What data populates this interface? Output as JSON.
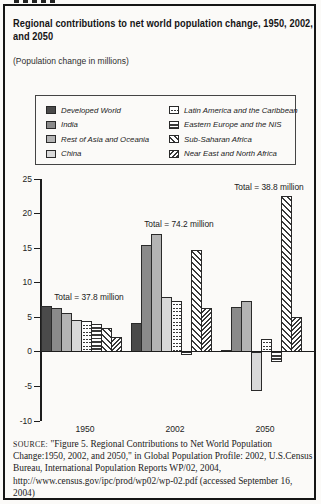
{
  "header": {
    "title": "Regional contributions to net world population change, 1950, 2002, and 2050",
    "subtitle": "(Population change in millions)"
  },
  "legend": {
    "items": [
      {
        "label": "Developed World",
        "key": "developed"
      },
      {
        "label": "India",
        "key": "india"
      },
      {
        "label": "Rest of Asia and Oceania",
        "key": "rest-asia"
      },
      {
        "label": "China",
        "key": "china"
      },
      {
        "label": "Latin America and the Caribbean",
        "key": "latin-america"
      },
      {
        "label": "Eastern Europe and the NIS",
        "key": "eastern-europe"
      },
      {
        "label": "Sub-Saharan Africa",
        "key": "sub-saharan"
      },
      {
        "label": "Near East and North Africa",
        "key": "near-east"
      }
    ]
  },
  "chart_data": {
    "type": "bar",
    "title": "Regional contributions to net world population change, 1950, 2002, and 2050",
    "xlabel": "",
    "ylabel": "Population change in millions",
    "categories": [
      "1950",
      "2002",
      "2050"
    ],
    "series": [
      {
        "name": "Developed World",
        "key": "developed",
        "values": [
          6.6,
          4.2,
          0.3
        ]
      },
      {
        "name": "India",
        "key": "india",
        "values": [
          6.3,
          15.5,
          6.5
        ]
      },
      {
        "name": "Rest of Asia and Oceania",
        "key": "rest-asia",
        "values": [
          5.6,
          17.1,
          7.3
        ]
      },
      {
        "name": "China",
        "key": "china",
        "values": [
          4.6,
          8.0,
          -5.6
        ]
      },
      {
        "name": "Latin America and the Caribbean",
        "key": "latin-america",
        "values": [
          4.4,
          7.3,
          1.8
        ]
      },
      {
        "name": "Eastern Europe and the NIS",
        "key": "eastern-europe",
        "values": [
          4.0,
          -0.4,
          -1.5
        ]
      },
      {
        "name": "Sub-Saharan Africa",
        "key": "sub-saharan",
        "values": [
          3.5,
          14.8,
          22.5
        ]
      },
      {
        "name": "Near East and North Africa",
        "key": "near-east",
        "values": [
          2.2,
          6.3,
          5.1
        ]
      }
    ],
    "group_totals": [
      {
        "category": "1950",
        "label": "Total = 37.8 million",
        "value": 37.8
      },
      {
        "category": "2002",
        "label": "Total = 74.2 million",
        "value": 74.2
      },
      {
        "category": "2050",
        "label": "Total = 38.8 million",
        "value": 38.8
      }
    ],
    "ylim": [
      -10,
      25
    ],
    "yticks": [
      25,
      20,
      15,
      10,
      5,
      0,
      -5,
      -10
    ],
    "grid": false,
    "legend_position": "top"
  },
  "colors": {
    "developed": "#4a4a4a",
    "india": "#8a8a8a",
    "rest_asia": "#b4b4b4",
    "china": "#d9d9d9",
    "pattern_line": "#3a3a3a",
    "pattern_bg": "#ffffff",
    "axis": "#1d1d1d"
  },
  "source": {
    "label": "SOURCE:",
    "text": " \"Figure 5. Regional Contributions to Net World Population Change:1950, 2002, and 2050,\" in Global Population Profile: 2002, U.S.Census Bureau, International Population Reports WP/02, 2004, http://www.census.gov/ipc/prod/wp02/wp-02.pdf (accessed September 16, 2004)"
  }
}
